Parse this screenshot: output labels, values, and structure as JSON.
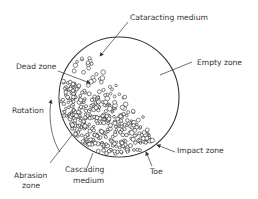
{
  "labels": {
    "cataracting": "Cataracting medium",
    "empty": "Empty zone",
    "dead": "Dead zone",
    "rotation": "Rotation",
    "impact": "Impact zone",
    "toe": "Toe",
    "abrasion_1": "Abrasion",
    "abrasion_2": "zone",
    "cascading_1": "Cascading",
    "cascading_2": "medium"
  },
  "colors": {
    "line": "#333333",
    "background": "#ffffff"
  },
  "geometry": {
    "mill_center": [
      119,
      97
    ],
    "mill_radius": 60
  }
}
